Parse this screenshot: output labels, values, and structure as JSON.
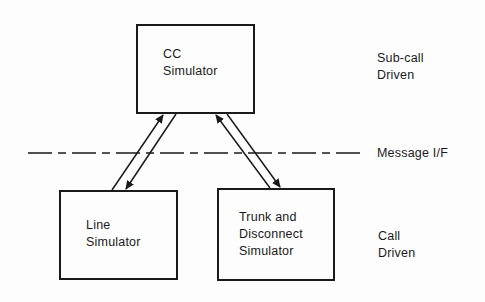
{
  "diagram": {
    "colors": {
      "ink": "#1a1a1a",
      "background": "#fdfdfd"
    },
    "boxes": {
      "cc_simulator": {
        "label": "CC\nSimulator"
      },
      "line_simulator": {
        "label": "Line\nSimulator"
      },
      "trunk_simulator": {
        "label": "Trunk and\nDisconnect\nSimulator"
      }
    },
    "side_labels": {
      "sub_call_driven": "Sub-call\nDriven",
      "message_if": "Message I/F",
      "call_driven": "Call\nDriven"
    },
    "connections": [
      {
        "from": "line_simulator",
        "to": "cc_simulator",
        "direction": "up"
      },
      {
        "from": "cc_simulator",
        "to": "line_simulator",
        "direction": "down"
      },
      {
        "from": "trunk_simulator",
        "to": "cc_simulator",
        "direction": "up"
      },
      {
        "from": "cc_simulator",
        "to": "trunk_simulator",
        "direction": "down"
      }
    ],
    "divider": {
      "style": "dash-dot long/short",
      "label_ref": "message_if"
    }
  }
}
